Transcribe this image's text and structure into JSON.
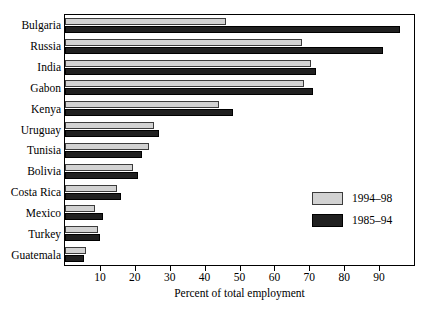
{
  "chart_data": {
    "type": "bar",
    "orientation": "horizontal",
    "title": "",
    "xlabel": "Percent of total employment",
    "ylabel": "",
    "xlim": [
      0,
      100
    ],
    "xticks": [
      10,
      20,
      30,
      40,
      50,
      60,
      70,
      80,
      90
    ],
    "grid": false,
    "legend_position": "inside-right",
    "categories": [
      "Bulgaria",
      "Russia",
      "India",
      "Gabon",
      "Kenya",
      "Uruguay",
      "Tunisia",
      "Bolivia",
      "Costa Rica",
      "Mexico",
      "Turkey",
      "Guatemala"
    ],
    "series": [
      {
        "name": "1994–98",
        "color": "#d2d2d2",
        "values": [
          46,
          68,
          70.5,
          68.5,
          44,
          25.5,
          24,
          19.5,
          15,
          8.5,
          9.5,
          6
        ]
      },
      {
        "name": "1985–94",
        "color": "#202020",
        "values": [
          96,
          91,
          72,
          71,
          48,
          27,
          22,
          21,
          16,
          11,
          10,
          5.5
        ]
      }
    ]
  },
  "legend": {
    "items": [
      {
        "label": "1994–98",
        "swatch": "light"
      },
      {
        "label": "1985–94",
        "swatch": "dark"
      }
    ]
  },
  "axis": {
    "x_title": "Percent of total employment",
    "x_tick_labels": [
      "10",
      "20",
      "30",
      "40",
      "50",
      "60",
      "70",
      "80",
      "90"
    ]
  },
  "colors": {
    "series_light": "#d2d2d2",
    "series_dark": "#202020",
    "frame": "#000000",
    "background": "#ffffff"
  }
}
